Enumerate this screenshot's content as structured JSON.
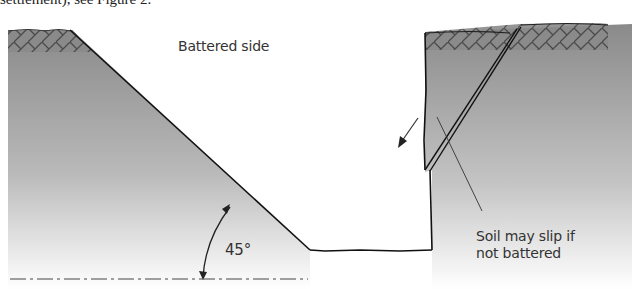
{
  "top_text": "settlement), see Figure 2.",
  "labels": {
    "battered_side": "Battered side",
    "angle": "45°",
    "soil_slip_line1": "Soil may slip if",
    "soil_slip_line2": "not battered"
  },
  "colors": {
    "soil_dark": "#8c8c8c",
    "soil_light": "#ffffff",
    "outline": "#1a1a1a"
  }
}
